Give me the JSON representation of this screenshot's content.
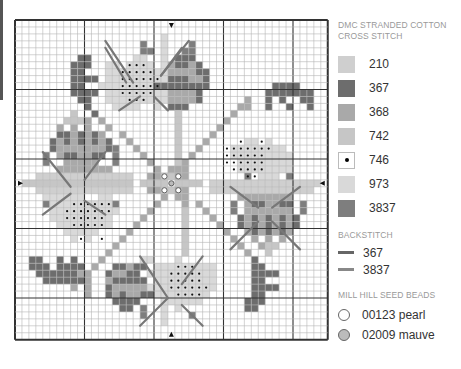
{
  "legend": {
    "stranded_title": [
      "DMC STRANDED COTTON",
      "CROSS STITCH"
    ],
    "swatches": [
      {
        "code": "210",
        "color": "#cfcfcf",
        "symbol": ""
      },
      {
        "code": "367",
        "color": "#6d6d6d",
        "symbol": ""
      },
      {
        "code": "368",
        "color": "#a9a9a9",
        "symbol": ""
      },
      {
        "code": "742",
        "color": "#c6c6c6",
        "symbol": ""
      },
      {
        "code": "746",
        "color": "#ffffff",
        "symbol": "dot"
      },
      {
        "code": "973",
        "color": "#d9d9d9",
        "symbol": ""
      },
      {
        "code": "3837",
        "color": "#7e7e7e",
        "symbol": ""
      }
    ],
    "backstitch_title": "BACKSTITCH",
    "backstitch": [
      {
        "code": "367",
        "color": "#666666"
      },
      {
        "code": "3837",
        "color": "#888888"
      }
    ],
    "beads_title": "MILL HILL SEED BEADS",
    "beads": [
      {
        "code": "00123 pearl",
        "fill": "#ffffff"
      },
      {
        "code": "02009 mauve",
        "fill": "#bbbbbb"
      }
    ]
  },
  "chart": {
    "cols": 45,
    "rows": 46,
    "cell": 6.95,
    "major_every": 10,
    "center_col": 22,
    "center_row": 23,
    "colors": {
      "a": "#cfcfcf",
      "b": "#6d6d6d",
      "c": "#a9a9a9",
      "d": "#c6c6c6",
      "e": "#d9d9d9",
      "f": "#7e7e7e"
    },
    "rows_map": [
      ".............................................",
      ".............................................",
      ".....................e.......................",
      "..................f..e...f...................",
      "..................ff.e..ff...................",
      ".........bb......ee..e.bbb...................",
      "........bbb..ee.eeee.ecbbcb..................",
      "........bb...eeeeeeeeeccccbb.................",
      "........bbbb.eeeeeeeeebbbccb.................",
      "........bb..eeeeeeeebbbbbbbb.........bbbb....",
      "........bbbb.eeeeeeeeeccccb.........bbbbbbb..",
      ".........bb..eeeeeeeeeccccb......c..b.b..bb..",
      "..........b...eeee..e.bbb.......cc..b..b..b..",
      "........d..b...........d.......c.............",
      ".......dddc.c..........d......c..............",
      "......c.c.c..c.........d.....c...............",
      "......bbcbcbc..c.......d....c................",
      ".....bcbcbcbcb..c......d...c.....ee.e........",
      ".....bcccccccbf..c.....d..c....eeeeeeee......",
      "....f.cbbccbb.f...c....d.c.....eeeeeeeee.....",
      "....f..ccccc..f....c...dc.......eeeeeeee.....",
      "......cccccccc......c.ccc.......eeeeeeee.....",
      "...aaaaaaaaaaaaaa..ccddcc........f.eee.f.....",
      ".dddddddddddddddd.dddd.dddd.aaaaaaaaaaaaaaaa.",
      "...aaaaaaaaaaaaaa..ccddcc...aaaaaaaaaaaaaaa..",
      "....eeeeee..ee.......c.cc.......cccccccc.....",
      "....feeeeeeeeef.....c...c.c....f.cbbccbb.f...",
      ".....eeeeeeeeee....c....d..c...f.ccccccc.f...",
      ".....eeeeeeeee....c.....d...c...bcbcbcbcb....",
      "......eeeeeeee...c......d....c..bcbcbcbcb....",
      ".......eeeee....c.......d.....c..cbcbcbc.....",
      "........e.e....c........d......c..c.c.c......",
      "..............c.........d.......c..cdd.......",
      ".............c..........d........c..d........",
      "..bb..b.b...c.....ee...e..........b..........",
      "..bbb.bbbb.c..bbcbb.eeeeeeeee.....bb.........",
      "...bbbbbbcc..bccbb.eeeeeeeeee.....bbbb.......",
      "....bbbbbbc..cbbbbb.eeeeeeeee.....bb.........",
      "........c.c..bccccceeeeeeeeee.....bbbb.......",
      "..........c..bcbccbbeeeeeeee......bb.........",
      "..............bbbb...eeeeee......bbb.........",
      "...............bb.f..e.e.........bb..........",
      "..................f..e...f...................",
      ".....................e.......................",
      ".............................................",
      "............................................."
    ],
    "dots": [
      [
        16,
        6
      ],
      [
        17,
        6
      ],
      [
        18,
        6
      ],
      [
        15,
        7
      ],
      [
        16,
        7
      ],
      [
        17,
        7
      ],
      [
        18,
        7
      ],
      [
        19,
        7
      ],
      [
        15,
        8
      ],
      [
        16,
        8
      ],
      [
        17,
        8
      ],
      [
        18,
        8
      ],
      [
        19,
        8
      ],
      [
        20,
        8
      ],
      [
        15,
        9
      ],
      [
        16,
        9
      ],
      [
        17,
        9
      ],
      [
        18,
        9
      ],
      [
        19,
        9
      ],
      [
        20,
        9
      ],
      [
        15,
        10
      ],
      [
        16,
        10
      ],
      [
        17,
        10
      ],
      [
        18,
        10
      ],
      [
        19,
        10
      ],
      [
        16,
        11
      ],
      [
        17,
        11
      ],
      [
        18,
        11
      ],
      [
        32,
        17
      ],
      [
        35,
        17
      ],
      [
        30,
        18
      ],
      [
        31,
        18
      ],
      [
        32,
        18
      ],
      [
        33,
        18
      ],
      [
        34,
        18
      ],
      [
        35,
        18
      ],
      [
        36,
        18
      ],
      [
        30,
        19
      ],
      [
        31,
        19
      ],
      [
        32,
        19
      ],
      [
        33,
        19
      ],
      [
        34,
        19
      ],
      [
        35,
        19
      ],
      [
        30,
        20
      ],
      [
        31,
        20
      ],
      [
        32,
        20
      ],
      [
        33,
        20
      ],
      [
        34,
        20
      ],
      [
        35,
        20
      ],
      [
        31,
        21
      ],
      [
        32,
        21
      ],
      [
        33,
        21
      ],
      [
        34,
        21
      ],
      [
        35,
        21
      ],
      [
        33,
        22
      ],
      [
        34,
        22
      ],
      [
        8,
        26
      ],
      [
        9,
        26
      ],
      [
        10,
        26
      ],
      [
        11,
        26
      ],
      [
        12,
        26
      ],
      [
        13,
        26
      ],
      [
        7,
        27
      ],
      [
        8,
        27
      ],
      [
        9,
        27
      ],
      [
        10,
        27
      ],
      [
        11,
        27
      ],
      [
        12,
        27
      ],
      [
        13,
        27
      ],
      [
        7,
        28
      ],
      [
        8,
        28
      ],
      [
        9,
        28
      ],
      [
        10,
        28
      ],
      [
        11,
        28
      ],
      [
        12,
        28
      ],
      [
        8,
        29
      ],
      [
        9,
        29
      ],
      [
        10,
        29
      ],
      [
        11,
        29
      ],
      [
        12,
        29
      ],
      [
        9,
        31
      ],
      [
        12,
        31
      ],
      [
        23,
        35
      ],
      [
        24,
        35
      ],
      [
        25,
        35
      ],
      [
        22,
        36
      ],
      [
        23,
        36
      ],
      [
        24,
        36
      ],
      [
        25,
        36
      ],
      [
        26,
        36
      ],
      [
        22,
        37
      ],
      [
        23,
        37
      ],
      [
        24,
        37
      ],
      [
        25,
        37
      ],
      [
        26,
        37
      ],
      [
        22,
        38
      ],
      [
        23,
        38
      ],
      [
        24,
        38
      ],
      [
        25,
        38
      ],
      [
        26,
        38
      ],
      [
        27,
        38
      ],
      [
        23,
        39
      ],
      [
        24,
        39
      ],
      [
        25,
        39
      ],
      [
        26,
        39
      ]
    ],
    "beads": [
      {
        "col": 21,
        "row": 22,
        "type": "pearl"
      },
      {
        "col": 23,
        "row": 22,
        "type": "pearl"
      },
      {
        "col": 21,
        "row": 24,
        "type": "pearl"
      },
      {
        "col": 23,
        "row": 24,
        "type": "pearl"
      },
      {
        "col": 22,
        "row": 23,
        "type": "mauve"
      }
    ],
    "arrows": [
      {
        "side": "top",
        "pos": 22
      },
      {
        "side": "bottom",
        "pos": 22
      },
      {
        "side": "left",
        "pos": 23
      },
      {
        "side": "right",
        "pos": 23
      }
    ],
    "backstitch_lines": [
      [
        13,
        3,
        17,
        9
      ],
      [
        13,
        4,
        16,
        9
      ],
      [
        25,
        3,
        21,
        8
      ],
      [
        24,
        4,
        21,
        8
      ],
      [
        15,
        13,
        18,
        11
      ],
      [
        22,
        13,
        20,
        11
      ],
      [
        4,
        19,
        8,
        24
      ],
      [
        13,
        19,
        10,
        23
      ],
      [
        4,
        28,
        8,
        25
      ],
      [
        13,
        28,
        10,
        26
      ],
      [
        31,
        24,
        35,
        27
      ],
      [
        41,
        24,
        37,
        27
      ],
      [
        31,
        33,
        35,
        29
      ],
      [
        41,
        33,
        37,
        29
      ],
      [
        18,
        34,
        22,
        40
      ],
      [
        27,
        34,
        24,
        38
      ],
      [
        18,
        44,
        22,
        40
      ],
      [
        27,
        44,
        24,
        41
      ]
    ]
  }
}
